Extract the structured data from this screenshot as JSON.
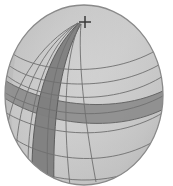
{
  "figure": {
    "name": "shaded-sphere-graticule",
    "type": "sphere-projection",
    "canvas": {
      "width": 173,
      "height": 186
    },
    "background_color": "#ffffff"
  },
  "sphere": {
    "center_x": 84,
    "center_y": 95,
    "radius_x": 79,
    "radius_y": 90,
    "fill_color": "#c8c8c8",
    "outline_color": "#8a8a8a",
    "outline_width": 1.2,
    "terminator_shade_color": "#b4b4b4",
    "highlight_color": "#d6d6d6"
  },
  "graticule": {
    "line_color": "#6f6f6f",
    "line_width": 0.9,
    "parallels": [
      {
        "label": "60N",
        "y_offset": -58,
        "curvature": 26
      },
      {
        "label": "45N",
        "y_offset": -38,
        "curvature": 30
      },
      {
        "label": "30N",
        "y_offset": -18,
        "curvature": 33
      },
      {
        "label": "15N",
        "y_offset": 2,
        "curvature": 35
      },
      {
        "label": "0",
        "y_offset": 22,
        "curvature": 36
      },
      {
        "label": "15S",
        "y_offset": 44,
        "curvature": 35
      },
      {
        "label": "30S",
        "y_offset": 66,
        "curvature": 31
      }
    ],
    "meridians": [
      {
        "label": "M1",
        "bottom_x_offset": -74
      },
      {
        "label": "M2",
        "bottom_x_offset": -62
      },
      {
        "label": "M3",
        "bottom_x_offset": -48
      },
      {
        "label": "M4",
        "bottom_x_offset": -30
      },
      {
        "label": "M5",
        "bottom_x_offset": -10
      },
      {
        "label": "M6",
        "bottom_x_offset": 12
      }
    ]
  },
  "highlighted_bands": {
    "meridian_band": {
      "name": "dark-meridian-band",
      "fill_color": "#7d7d7d",
      "edge_color": "#5e5e5e",
      "description": "wide dark band running from pole toward lower-left limb"
    },
    "parallel_band": {
      "name": "dark-parallel-band",
      "fill_color": "#8c8c8c",
      "edge_color": "#6a6a6a",
      "description": "wide dark latitude band crossing the right hemisphere"
    }
  },
  "markers": [
    {
      "name": "pole-marker",
      "glyph": "+",
      "color": "#3a3a3a",
      "x": 85,
      "y": 22,
      "size": 13
    }
  ],
  "pole": {
    "name": "north-pole-convergence",
    "x": 79,
    "y": 24
  }
}
